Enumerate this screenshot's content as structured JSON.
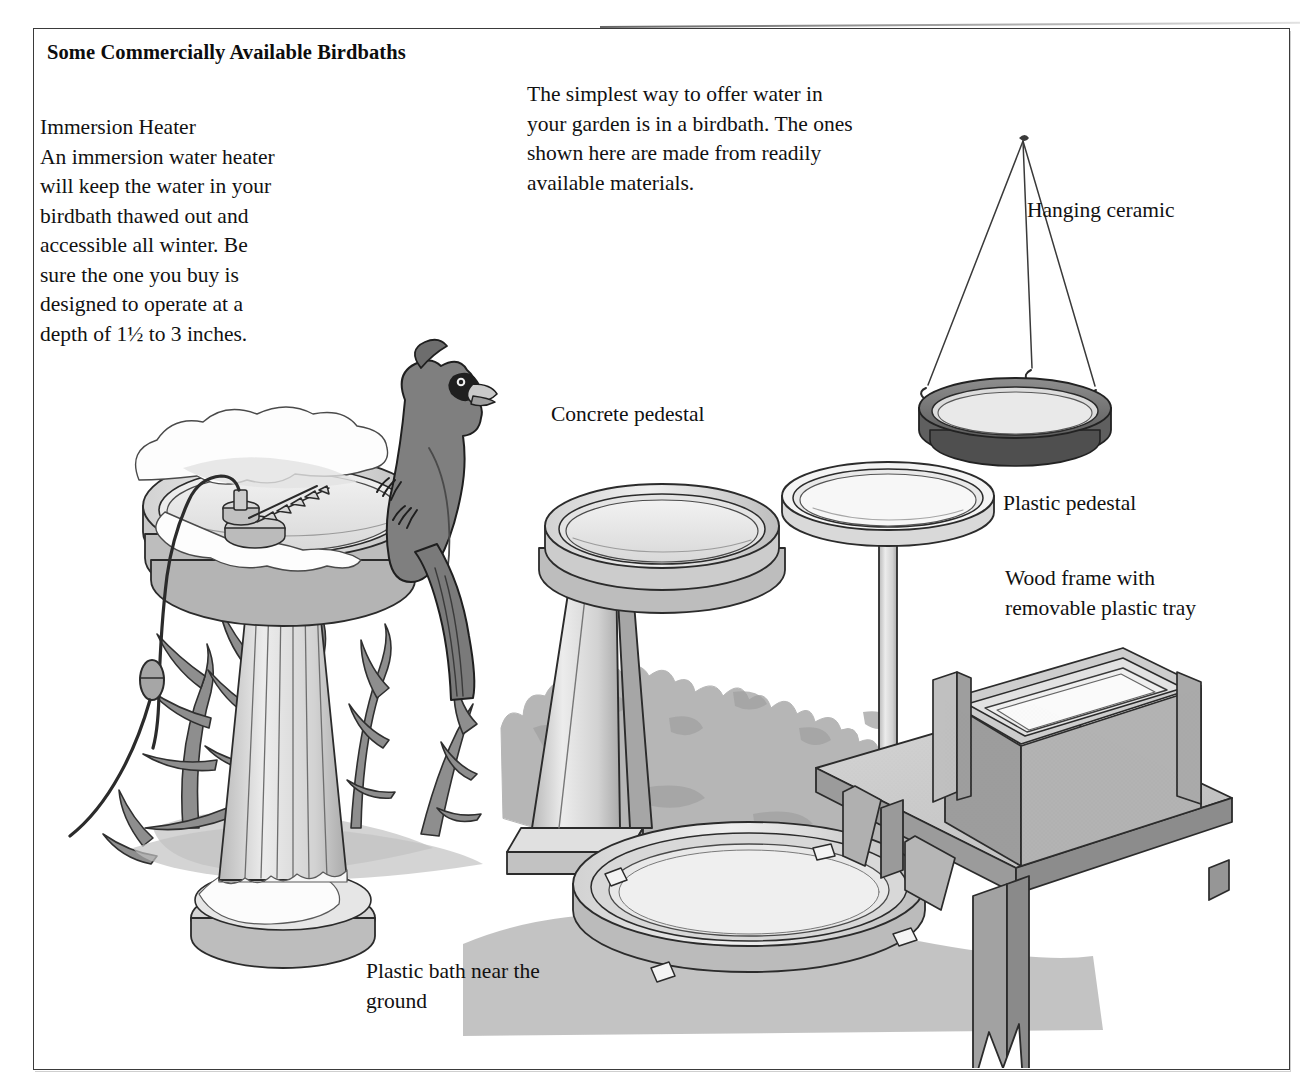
{
  "figure": {
    "title": "Some Commercially Available Birdbaths",
    "border_color": "#3a3a3a",
    "background_color": "#ffffff"
  },
  "text_blocks": {
    "heater": {
      "heading": "Immersion Heater",
      "body": "An immersion water heater will keep the water in your birdbath thawed out and accessible all winter. Be sure the one you buy is designed to operate at a depth of 1½ to 3 inches.",
      "full": "Immersion Heater\nAn immersion water heater\nwill keep the water in your\nbirdbath thawed out and\naccessible all winter. Be\nsure the one you buy is\ndesigned to operate at a\ndepth of 1½ to 3 inches."
    },
    "intro": {
      "body": "The simplest way to offer water in your garden is in a birdbath. The ones shown here are made from readily available materials.",
      "full": "The simplest way to offer water in\nyour garden is in a birdbath. The ones\nshown here are made from readily\navailable materials."
    }
  },
  "callouts": {
    "hanging_ceramic": "Hanging ceramic",
    "concrete_pedestal": "Concrete pedestal",
    "plastic_pedestal": "Plastic pedestal",
    "wood_frame": "Wood frame with\nremovable plastic tray",
    "plastic_ground": "Plastic bath near the\nground"
  },
  "illustrations": [
    {
      "name": "heated-birdbath",
      "label": "Immersion Heater",
      "parts": [
        "snow-covered basin",
        "immersion heater unit",
        "power cord with plug",
        "fluted pedestal",
        "snow-covered round base",
        "bare shrub branches",
        "gray cardinal perched on rim"
      ]
    },
    {
      "name": "concrete-pedestal-birdbath",
      "label": "Concrete pedestal",
      "parts": [
        "round basin",
        "tapered square column",
        "square footing"
      ]
    },
    {
      "name": "plastic-pedestal-birdbath",
      "label": "Plastic pedestal",
      "parts": [
        "shallow round dish",
        "thin pole"
      ]
    },
    {
      "name": "hanging-ceramic-birdbath",
      "label": "Hanging ceramic",
      "parts": [
        "three suspension wires",
        "apex knot",
        "S-hooks",
        "dark ceramic bowl"
      ]
    },
    {
      "name": "wood-frame-birdbath",
      "label": "Wood frame with removable plastic tray",
      "parts": [
        "wood bench with notched legs",
        "rectangular wood box frame",
        "removable plastic tray"
      ]
    },
    {
      "name": "plastic-ground-birdbath",
      "label": "Plastic bath near the ground",
      "parts": [
        "shallow circular dish",
        "four rim clips"
      ]
    },
    {
      "name": "background-shrubs",
      "label": "shrubbery",
      "parts": [
        "gray foliage mass",
        "cast shadows"
      ]
    }
  ],
  "palette": {
    "ink": "#111111",
    "line": "#2b2b2b",
    "light_gray": "#e8e8e8",
    "mid_gray": "#c4c4c4",
    "shadow_gray": "#a8a8a8",
    "dark_gray": "#8a8a8a",
    "bird_gray": "#7f7f7f",
    "ceramic_dark": "#6f6f6f",
    "snow": "#fdfdfd"
  }
}
